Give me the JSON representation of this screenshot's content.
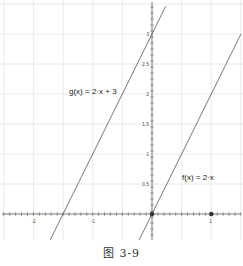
{
  "caption": "图 3-9",
  "labels": {
    "g": "g(x) = 2·x + 3",
    "f": "f(x) = 2·x"
  },
  "colors": {
    "grid": "#e4e4e4",
    "axis": "#555555",
    "line": "#555555",
    "point": "#333333"
  },
  "chart_data": {
    "type": "line",
    "title": "",
    "xlabel": "",
    "ylabel": "",
    "xlim": [
      -2.5,
      1.5
    ],
    "ylim": [
      -0.45,
      3.5
    ],
    "grid": true,
    "x_ticks": [
      -2,
      -1,
      1
    ],
    "y_ticks": [
      0.5,
      1,
      1.5,
      2,
      2.5,
      3
    ],
    "x_tick_labels": [
      "-2",
      "-1",
      "1"
    ],
    "y_tick_labels": [
      "0.5",
      "1",
      "1.5",
      "2",
      "2.5",
      "3"
    ],
    "series": [
      {
        "name": "g(x) = 2·x + 3",
        "x": [
          -1.85,
          0.23
        ],
        "y": [
          -0.7,
          3.46
        ]
      },
      {
        "name": "f(x) = 2·x",
        "x": [
          -0.3,
          1.5
        ],
        "y": [
          -0.6,
          3.0
        ]
      }
    ],
    "points": [
      {
        "x": 0,
        "y": 0
      },
      {
        "x": 1,
        "y": 0
      }
    ],
    "annotations": [
      {
        "text": "g(x) = 2·x + 3",
        "x": -1.0,
        "y": 2.1
      },
      {
        "text": "f(x) = 2·x",
        "x": 0.7,
        "y": 0.65
      }
    ]
  }
}
